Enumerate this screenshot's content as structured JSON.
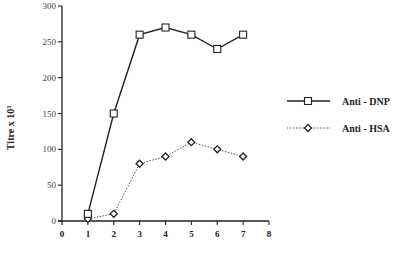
{
  "chart_data": {
    "type": "line",
    "title": "",
    "xlabel": "",
    "ylabel": "Titre x 10³",
    "xlim": [
      0,
      8
    ],
    "ylim": [
      0,
      300
    ],
    "x_ticks": [
      "0",
      "1",
      "2",
      "3",
      "4",
      "5",
      "6",
      "7",
      "8"
    ],
    "y_ticks": [
      "0",
      "50",
      "100",
      "150",
      "200",
      "250",
      "300"
    ],
    "grid": false,
    "legend_position": "right",
    "x": [
      1,
      2,
      3,
      4,
      5,
      6,
      7
    ],
    "series": [
      {
        "name": "Anti - DNP",
        "marker": "square",
        "line": "solid",
        "values": [
          10,
          150,
          260,
          270,
          260,
          240,
          260
        ]
      },
      {
        "name": "Anti - HSA",
        "marker": "diamond",
        "line": "dotted",
        "values": [
          3,
          10,
          80,
          90,
          110,
          100,
          90
        ]
      }
    ]
  },
  "axes": {
    "y_title": "Titre x 10³"
  },
  "legend": {
    "items": [
      {
        "label": "Anti - DNP"
      },
      {
        "label": "Anti - HSA"
      }
    ]
  }
}
